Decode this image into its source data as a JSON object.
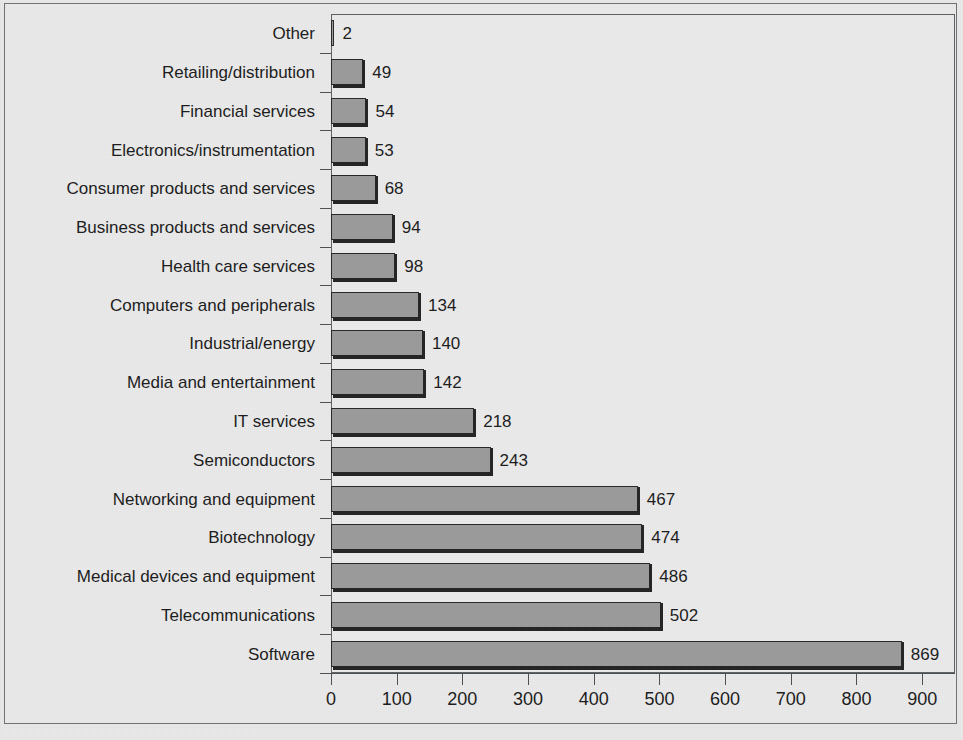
{
  "chart_data": {
    "type": "bar",
    "orientation": "horizontal",
    "title": "",
    "subtitle": "",
    "xlabel": "",
    "ylabel": "",
    "xlim": [
      0,
      950
    ],
    "grid": false,
    "legend": null,
    "xticks": [
      0,
      100,
      200,
      300,
      400,
      500,
      600,
      700,
      800,
      900
    ],
    "xtick_labels": [
      "0",
      "100",
      "200",
      "300",
      "400",
      "500",
      "600",
      "700",
      "800",
      "900"
    ],
    "categories": [
      "Other",
      "Retailing/distribution",
      "Financial services",
      "Electronics/instrumentation",
      "Consumer products and services",
      "Business products and services",
      "Health care services",
      "Computers and peripherals",
      "Industrial/energy",
      "Media and entertainment",
      "IT services",
      "Semiconductors",
      "Networking and equipment",
      "Biotechnology",
      "Medical devices and equipment",
      "Telecommunications",
      "Software"
    ],
    "values": [
      2,
      49,
      54,
      53,
      68,
      94,
      98,
      134,
      140,
      142,
      218,
      243,
      467,
      474,
      486,
      502,
      869
    ],
    "value_labels": [
      "2",
      "49",
      "54",
      "53",
      "68",
      "94",
      "98",
      "134",
      "140",
      "142",
      "218",
      "243",
      "467",
      "474",
      "486",
      "502",
      "869"
    ],
    "bar_color": "#9b9b9b",
    "bar_edge_color": "#262626",
    "plot_background": "#ebebeb",
    "figure_background": "#eaeaea",
    "axis_color": "#4d5052",
    "text_color": "#1b1b1b"
  }
}
